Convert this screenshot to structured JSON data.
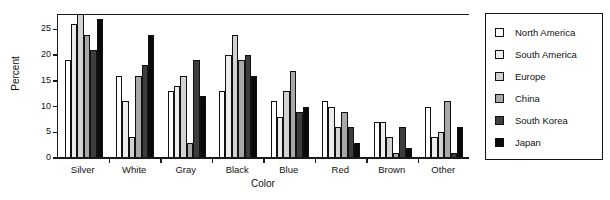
{
  "chart_data": {
    "type": "bar",
    "title": "",
    "xlabel": "Color",
    "ylabel": "Percent",
    "ylim": [
      0,
      28
    ],
    "yticks": [
      0,
      5,
      10,
      15,
      20,
      25
    ],
    "grid": false,
    "legend_position": "right",
    "categories": [
      "Silver",
      "White",
      "Gray",
      "Black",
      "Blue",
      "Red",
      "Brown",
      "Other"
    ],
    "series": [
      {
        "name": "North America",
        "color": "#ffffff",
        "values": [
          19,
          16,
          13,
          13,
          11,
          11,
          7,
          10
        ]
      },
      {
        "name": "South America",
        "color": "#ececec",
        "values": [
          26,
          11,
          14,
          20,
          8,
          10,
          7,
          4
        ]
      },
      {
        "name": "Europe",
        "color": "#d2d2d2",
        "values": [
          28,
          4,
          16,
          24,
          13,
          6,
          4,
          5
        ]
      },
      {
        "name": "China",
        "color": "#a8a8a8",
        "values": [
          24,
          16,
          3,
          19,
          17,
          9,
          1,
          11
        ]
      },
      {
        "name": "South Korea",
        "color": "#3d3d3d",
        "values": [
          21,
          18,
          19,
          20,
          9,
          6,
          6,
          1
        ]
      },
      {
        "name": "Japan",
        "color": "#0a0a0a",
        "values": [
          27,
          24,
          12,
          16,
          10,
          3,
          2,
          6
        ]
      }
    ]
  }
}
